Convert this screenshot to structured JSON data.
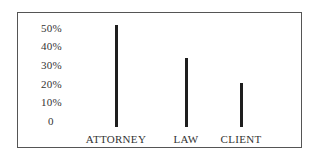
{
  "chart_data": {
    "type": "bar",
    "title": "",
    "xlabel": "",
    "ylabel": "",
    "categories": [
      "ATTORNEY",
      "LAW",
      "CLIENT"
    ],
    "values": [
      52,
      34,
      21
    ],
    "unit": "%",
    "ylim": [
      0,
      50
    ],
    "yticks": [
      "0",
      "10%",
      "20%",
      "30%",
      "40%",
      "50%"
    ],
    "grid": false,
    "legend": null,
    "bar_color": "#1e1e1e"
  }
}
